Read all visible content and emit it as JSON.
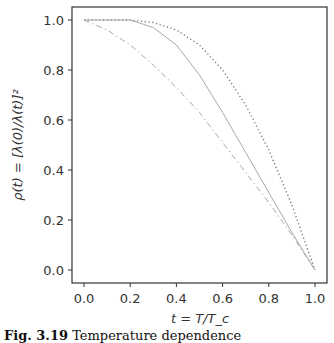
{
  "chart_data": {
    "type": "line",
    "title": "",
    "xlabel": "t = T/T_c",
    "ylabel": "ρ(t) = [λ(0)/λ(t)]²",
    "xlim": [
      -0.05,
      1.05
    ],
    "ylim": [
      -0.05,
      1.05
    ],
    "grid": false,
    "legend": null,
    "x_ticks": [
      "0.0",
      "0.2",
      "0.4",
      "0.6",
      "0.8",
      "1.0"
    ],
    "y_ticks": [
      "0.0",
      "0.2",
      "0.4",
      "0.6",
      "0.8",
      "1.0"
    ],
    "x": [
      0.0,
      0.1,
      0.2,
      0.3,
      0.4,
      0.5,
      0.6,
      0.7,
      0.8,
      0.9,
      1.0
    ],
    "series": [
      {
        "name": "dotted",
        "style": "dotted",
        "color": "#777777",
        "values": [
          1.0,
          1.0,
          1.0,
          0.99,
          0.96,
          0.9,
          0.8,
          0.66,
          0.48,
          0.26,
          0.0
        ]
      },
      {
        "name": "solid",
        "style": "solid",
        "color": "#aaaaaa",
        "values": [
          1.0,
          1.0,
          1.0,
          0.97,
          0.9,
          0.78,
          0.63,
          0.47,
          0.31,
          0.15,
          0.0
        ]
      },
      {
        "name": "dash-dot",
        "style": "dashdot",
        "color": "#aaaaaa",
        "values": [
          1.0,
          0.96,
          0.9,
          0.82,
          0.73,
          0.63,
          0.51,
          0.39,
          0.27,
          0.14,
          0.0
        ]
      }
    ]
  },
  "caption": {
    "label": "Fig. 3.19",
    "text": "Temperature dependence"
  }
}
